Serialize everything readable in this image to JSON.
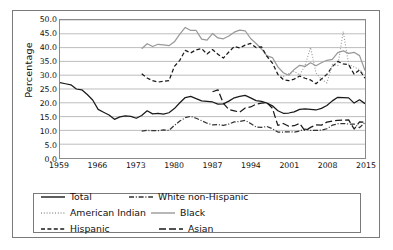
{
  "chart_data": {
    "type": "line",
    "title": "",
    "xlabel": "",
    "ylabel": "Percentage",
    "xlim": [
      1959,
      2015
    ],
    "ylim": [
      0.0,
      50.0
    ],
    "grid": "horizontal",
    "legend_position": "bottom",
    "y_ticks": [
      "50.0",
      "45.0",
      "40.0",
      "35.0",
      "30.0",
      "25.0",
      "20.0",
      "15.0",
      "10.0",
      "5.0",
      "0.0"
    ],
    "x_ticks": [
      "1959",
      "1966",
      "1973",
      "1980",
      "1987",
      "1994",
      "2001",
      "2008",
      "2015"
    ],
    "series": [
      {
        "name": "Total",
        "style": "solid",
        "color": "#1a1a1a",
        "x": [
          1959,
          1960,
          1961,
          1962,
          1963,
          1964,
          1965,
          1966,
          1967,
          1968,
          1969,
          1970,
          1971,
          1972,
          1973,
          1974,
          1975,
          1976,
          1977,
          1978,
          1979,
          1980,
          1981,
          1982,
          1983,
          1984,
          1985,
          1986,
          1987,
          1988,
          1989,
          1990,
          1991,
          1992,
          1993,
          1994,
          1995,
          1996,
          1997,
          1998,
          1999,
          2000,
          2001,
          2002,
          2003,
          2004,
          2005,
          2006,
          2007,
          2008,
          2009,
          2010,
          2011,
          2012,
          2013,
          2014,
          2015
        ],
        "values": [
          27.3,
          26.9,
          26.5,
          25.0,
          24.7,
          23.0,
          21.0,
          17.6,
          16.6,
          15.6,
          14.0,
          14.9,
          15.3,
          15.1,
          14.4,
          15.4,
          17.1,
          16.0,
          16.2,
          15.9,
          16.4,
          17.9,
          20.0,
          21.9,
          22.3,
          21.5,
          20.7,
          20.5,
          20.3,
          19.5,
          19.6,
          20.6,
          21.8,
          22.3,
          22.7,
          21.8,
          20.8,
          20.5,
          19.9,
          18.9,
          17.1,
          16.2,
          16.3,
          16.7,
          17.6,
          17.8,
          17.6,
          17.4,
          18.0,
          19.0,
          20.7,
          22.0,
          21.9,
          21.8,
          19.9,
          21.1,
          19.7
        ]
      },
      {
        "name": "White non-Hispanic",
        "style": "dashdot",
        "color": "#333333",
        "x": [
          1974,
          1975,
          1976,
          1977,
          1978,
          1979,
          1980,
          1981,
          1982,
          1983,
          1984,
          1985,
          1986,
          1987,
          1988,
          1989,
          1990,
          1991,
          1992,
          1993,
          1994,
          1995,
          1996,
          1997,
          1998,
          1999,
          2000,
          2001,
          2002,
          2003,
          2004,
          2005,
          2006,
          2007,
          2008,
          2009,
          2010,
          2011,
          2012,
          2013,
          2014,
          2015
        ],
        "values": [
          9.7,
          10.0,
          9.9,
          9.9,
          10.2,
          10.0,
          11.8,
          13.4,
          14.6,
          15.1,
          14.4,
          13.5,
          12.6,
          12.0,
          12.1,
          11.8,
          12.3,
          13.1,
          13.2,
          13.6,
          12.5,
          11.2,
          11.1,
          11.4,
          10.6,
          9.4,
          9.4,
          9.5,
          9.4,
          9.8,
          10.5,
          10.0,
          10.0,
          10.1,
          10.6,
          11.9,
          12.4,
          12.5,
          12.3,
          12.3,
          11.0,
          12.9
        ]
      },
      {
        "name": "Black",
        "style": "solid",
        "color": "#999999",
        "x": [
          1974,
          1975,
          1976,
          1977,
          1978,
          1979,
          1980,
          1981,
          1982,
          1983,
          1984,
          1985,
          1986,
          1987,
          1988,
          1989,
          1990,
          1991,
          1992,
          1993,
          1994,
          1995,
          1996,
          1997,
          1998,
          1999,
          2000,
          2001,
          2002,
          2003,
          2004,
          2005,
          2006,
          2007,
          2008,
          2009,
          2010,
          2011,
          2012,
          2013,
          2014,
          2015
        ],
        "values": [
          39.6,
          41.4,
          40.4,
          41.2,
          41.0,
          40.7,
          42.1,
          44.9,
          47.3,
          46.2,
          46.2,
          43.1,
          42.7,
          45.1,
          43.5,
          43.2,
          44.2,
          45.6,
          46.3,
          46.1,
          43.3,
          41.5,
          39.5,
          37.0,
          36.4,
          33.0,
          30.9,
          30.0,
          32.1,
          33.6,
          33.2,
          34.5,
          33.4,
          34.5,
          35.4,
          35.7,
          38.2,
          38.8,
          37.9,
          38.3,
          37.1,
          31.7
        ]
      },
      {
        "name": "Hispanic",
        "style": "dashed",
        "color": "#1a1a1a",
        "x": [
          1974,
          1975,
          1976,
          1977,
          1978,
          1979,
          1980,
          1981,
          1982,
          1983,
          1984,
          1985,
          1986,
          1987,
          1988,
          1989,
          1990,
          1991,
          1992,
          1993,
          1994,
          1995,
          1996,
          1997,
          1998,
          1999,
          2000,
          2001,
          2002,
          2003,
          2004,
          2005,
          2006,
          2007,
          2008,
          2009,
          2010,
          2011,
          2012,
          2013,
          2014,
          2015
        ],
        "values": [
          30.5,
          29.0,
          28.0,
          27.5,
          27.8,
          28.0,
          33.2,
          35.4,
          39.0,
          38.1,
          39.2,
          39.6,
          37.7,
          39.3,
          37.6,
          36.2,
          38.4,
          40.4,
          39.9,
          40.9,
          41.5,
          40.0,
          40.3,
          36.8,
          34.4,
          30.3,
          28.4,
          28.0,
          28.6,
          29.7,
          28.9,
          28.3,
          26.9,
          28.6,
          30.3,
          33.1,
          35.0,
          34.1,
          33.8,
          30.4,
          31.9,
          28.9
        ]
      },
      {
        "name": "American Indian",
        "style": "dotted",
        "color": "#9a9a9a",
        "x": [
          1999,
          2000,
          2001,
          2002,
          2003,
          2004,
          2005,
          2006,
          2007,
          2008,
          2009,
          2010,
          2011,
          2012,
          2013,
          2014,
          2015
        ],
        "values": [
          30.0,
          29.5,
          30.5,
          31.5,
          30.0,
          33.6,
          40.1,
          30.8,
          28.5,
          27.2,
          33.9,
          33.5,
          45.8,
          34.0,
          33.0,
          32.0,
          30.0
        ]
      },
      {
        "name": "Asian",
        "style": "longdash",
        "color": "#1a1a1a",
        "x": [
          1987,
          1988,
          1989,
          1990,
          1991,
          1992,
          1993,
          1994,
          1995,
          1996,
          1997,
          1998,
          1999,
          2000,
          2001,
          2002,
          2003,
          2004,
          2005,
          2006,
          2007,
          2008,
          2009,
          2010,
          2011,
          2012,
          2013,
          2014,
          2015
        ],
        "values": [
          24.0,
          24.7,
          19.8,
          17.6,
          17.1,
          16.6,
          18.1,
          18.5,
          19.5,
          19.9,
          20.0,
          18.0,
          11.8,
          12.5,
          11.5,
          11.7,
          12.5,
          9.8,
          11.1,
          12.0,
          11.9,
          13.0,
          13.4,
          13.6,
          13.7,
          13.8,
          10.5,
          13.1,
          12.9
        ]
      }
    ]
  },
  "axis": {
    "y_label": "Percentage",
    "y_ticks": [
      "50.0",
      "45.0",
      "40.0",
      "35.0",
      "30.0",
      "25.0",
      "20.0",
      "15.0",
      "10.0",
      "5.0",
      "0.0"
    ],
    "x_ticks": [
      "1959",
      "1966",
      "1973",
      "1980",
      "1987",
      "1994",
      "2001",
      "2008",
      "2015"
    ]
  },
  "legend": {
    "entries": [
      {
        "label": "Total",
        "style": "solid",
        "color": "#1a1a1a"
      },
      {
        "label": "White non-Hispanic",
        "style": "dashdot",
        "color": "#333333"
      },
      {
        "label": "American Indian",
        "style": "dotted",
        "color": "#9a9a9a"
      },
      {
        "label": "Black",
        "style": "solid",
        "color": "#999999"
      },
      {
        "label": "Hispanic",
        "style": "dashed",
        "color": "#1a1a1a"
      },
      {
        "label": "Asian",
        "style": "longdash",
        "color": "#1a1a1a"
      }
    ]
  }
}
